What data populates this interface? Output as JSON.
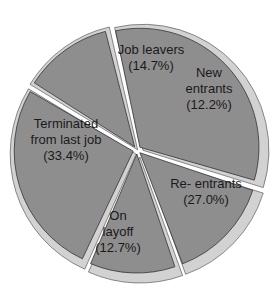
{
  "chart_data": {
    "type": "pie",
    "title": "",
    "style": "exploded 3D pie",
    "start_angle_deg": -13,
    "colors": {
      "face": "#8e8e8e",
      "edge": "#d2d2d2",
      "outline": "#333333",
      "background": "#ffffff"
    },
    "slices": [
      {
        "name": "Terminated from last job",
        "label_lines": [
          "Terminated",
          "from last job",
          "(33.4%)"
        ],
        "value": 33.4,
        "label_pos": [
          66,
          140
        ]
      },
      {
        "name": "Job leavers",
        "label_lines": [
          "Job leavers",
          "(14.7%)"
        ],
        "value": 14.7,
        "label_pos": [
          151,
          58
        ]
      },
      {
        "name": "New entrants",
        "label_lines": [
          "New",
          "entrants",
          "(12.2%)"
        ],
        "value": 12.2,
        "label_pos": [
          209,
          89
        ]
      },
      {
        "name": "Re- entrants",
        "label_lines": [
          "Re- entrants",
          "(27.0%)"
        ],
        "value": 27.0,
        "label_pos": [
          206,
          192
        ]
      },
      {
        "name": "On layoff",
        "label_lines": [
          "On",
          "layoff",
          "(12.7%)"
        ],
        "value": 12.7,
        "label_pos": [
          118,
          232
        ]
      }
    ],
    "legend": null
  }
}
